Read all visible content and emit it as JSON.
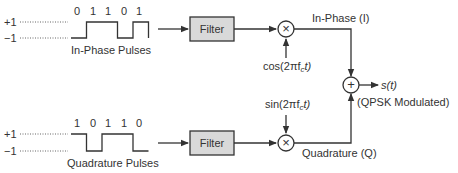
{
  "colors": {
    "line": "#333333",
    "filter_fill": "#d9d9d9",
    "text": "#333333"
  },
  "levels": {
    "high": "+1",
    "low": "−1"
  },
  "in_phase": {
    "bits": [
      "0",
      "1",
      "1",
      "0",
      "1"
    ],
    "pulses_label": "In-Phase Pulses",
    "filter_label": "Filter",
    "mixer_symbol": "×",
    "carrier_label": "cos(2πf",
    "carrier_sub": "c",
    "carrier_tail": "t)",
    "branch_label": "In-Phase (I)"
  },
  "quadrature": {
    "bits": [
      "1",
      "0",
      "1",
      "1",
      "0"
    ],
    "pulses_label": "Quadrature Pulses",
    "filter_label": "Filter",
    "mixer_symbol": "×",
    "carrier_label": "sin(2πf",
    "carrier_sub": "c",
    "carrier_tail": "t)",
    "branch_label": "Quadrature (Q)"
  },
  "summer": {
    "symbol": "+",
    "output_label": "s(t)",
    "output_note": "(QPSK Modulated)"
  }
}
